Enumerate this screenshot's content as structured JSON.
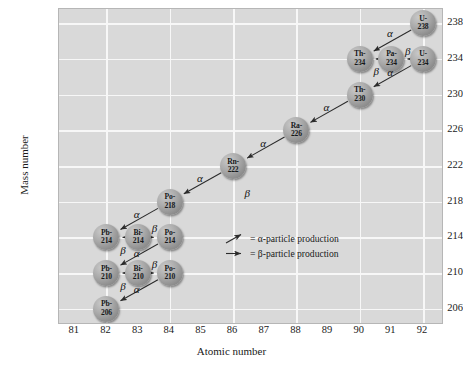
{
  "chart_data": {
    "type": "scatter",
    "title": "",
    "xlabel": "Atomic number",
    "ylabel": "Mass number",
    "xlim": [
      80.5,
      92.6
    ],
    "ylim": [
      204.4,
      239.6
    ],
    "xticks": [
      81,
      82,
      83,
      84,
      85,
      86,
      87,
      88,
      89,
      90,
      91,
      92
    ],
    "yticks": [
      206,
      210,
      214,
      218,
      222,
      226,
      230,
      234,
      238
    ],
    "grid": true,
    "legend_position": "inside-center-right",
    "nodes": [
      {
        "id": "U-238",
        "element": "U-",
        "mass": "238",
        "x": 92,
        "y": 238
      },
      {
        "id": "Th-234",
        "element": "Th-",
        "mass": "234",
        "x": 90,
        "y": 234
      },
      {
        "id": "Pa-234",
        "element": "Pa-",
        "mass": "234",
        "x": 91,
        "y": 234
      },
      {
        "id": "U-234",
        "element": "U-",
        "mass": "234",
        "x": 92,
        "y": 234
      },
      {
        "id": "Th-230",
        "element": "Th-",
        "mass": "230",
        "x": 90,
        "y": 230
      },
      {
        "id": "Ra-226",
        "element": "Ra-",
        "mass": "226",
        "x": 88,
        "y": 226
      },
      {
        "id": "Rn-222",
        "element": "Rn-",
        "mass": "222",
        "x": 86,
        "y": 222
      },
      {
        "id": "Po-218",
        "element": "Po-",
        "mass": "218",
        "x": 84,
        "y": 218
      },
      {
        "id": "Pb-214",
        "element": "Pb-",
        "mass": "214",
        "x": 82,
        "y": 214
      },
      {
        "id": "Bi-214",
        "element": "Bi-",
        "mass": "214",
        "x": 83,
        "y": 214
      },
      {
        "id": "Po-214",
        "element": "Po-",
        "mass": "214",
        "x": 84,
        "y": 214
      },
      {
        "id": "Pb-210",
        "element": "Pb-",
        "mass": "210",
        "x": 82,
        "y": 210
      },
      {
        "id": "Bi-210",
        "element": "Bi-",
        "mass": "210",
        "x": 83,
        "y": 210
      },
      {
        "id": "Po-210",
        "element": "Po-",
        "mass": "210",
        "x": 84,
        "y": 210
      },
      {
        "id": "Pb-206",
        "element": "Pb-",
        "mass": "206",
        "x": 82,
        "y": 206
      }
    ],
    "decays": [
      {
        "from": "U-238",
        "to": "Th-234",
        "type": "alpha",
        "label": "α",
        "lx": 90.95,
        "ly": 236.9
      },
      {
        "from": "Pa-234",
        "to": "Th-234",
        "type": "beta",
        "label": "β",
        "lx": 90.52,
        "ly": 232.6
      },
      {
        "from": "U-234",
        "to": "Pa-234",
        "type": "beta",
        "label": "β",
        "lx": 91.52,
        "ly": 234.9
      },
      {
        "from": "U-234",
        "to": "Th-230",
        "type": "alpha",
        "label": "α",
        "lx": 90.96,
        "ly": 232.5
      },
      {
        "from": "Th-230",
        "to": "Ra-226",
        "type": "alpha",
        "label": "α",
        "lx": 88.95,
        "ly": 228.6
      },
      {
        "from": "Ra-226",
        "to": "Rn-222",
        "type": "alpha",
        "label": "α",
        "lx": 86.95,
        "ly": 224.6
      },
      {
        "from": "Rn-222",
        "to": "Po-218",
        "type": "alpha",
        "label": "α",
        "lx": 84.95,
        "ly": 220.6
      },
      {
        "from": "Po-218",
        "to": "Pb-214",
        "type": "alpha",
        "label": "α",
        "lx": 82.95,
        "ly": 216.6
      },
      {
        "from": "Bi-214",
        "to": "Pb-214",
        "type": "beta",
        "label": "β",
        "lx": 82.52,
        "ly": 212.6
      },
      {
        "from": "Bi-214",
        "to": "Po-214",
        "type": "beta",
        "label": "β",
        "lx": 83.52,
        "ly": 215.0
      },
      {
        "from": "Po-214",
        "to": "Pb-210",
        "type": "alpha",
        "label": "α",
        "lx": 82.95,
        "ly": 212.2
      },
      {
        "from": "Bi-210",
        "to": "Pb-210",
        "type": "beta",
        "label": "β",
        "lx": 82.52,
        "ly": 208.6
      },
      {
        "from": "Bi-210",
        "to": "Po-210",
        "type": "beta",
        "label": "β",
        "lx": 83.52,
        "ly": 211.0
      },
      {
        "from": "Po-210",
        "to": "Pb-206",
        "type": "alpha",
        "label": "α",
        "lx": 82.95,
        "ly": 208.2
      }
    ],
    "floating_labels": [
      {
        "label": "β",
        "x": 86.45,
        "y": 219.0
      }
    ],
    "legend": [
      {
        "icon": "alpha-arrow-icon",
        "text": "= α-particle production"
      },
      {
        "icon": "beta-arrow-icon",
        "text": "= β-particle production"
      }
    ],
    "colors": {
      "plot_background": "#d9d9d9",
      "gridline": "#f7f7f7",
      "node_fill": "#a0a0a0",
      "arrow": "#2b2b2b",
      "text": "#1a1a1a"
    }
  }
}
